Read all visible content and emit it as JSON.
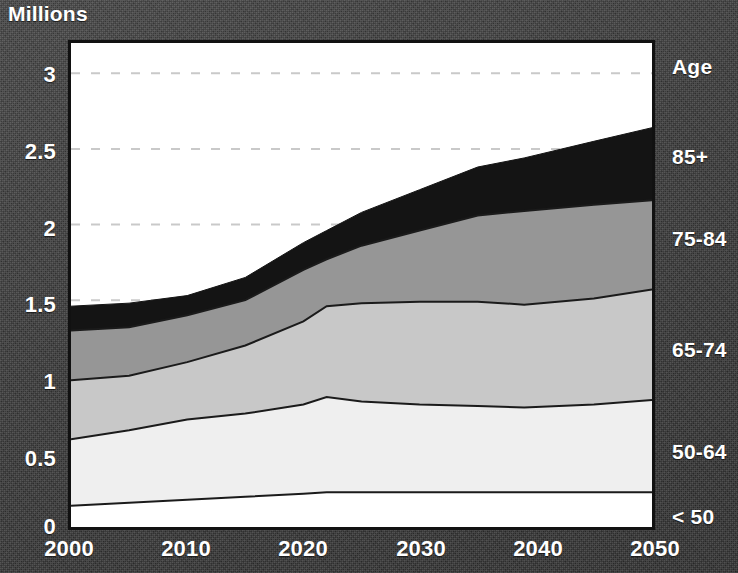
{
  "title": "Millions",
  "axis": {
    "y_label": "Millions",
    "y_ticks": [
      "3",
      "2.5",
      "2",
      "1.5",
      "1",
      "0.5",
      "0"
    ],
    "x_ticks": [
      "2000",
      "2010",
      "2020",
      "2030",
      "2040",
      "2050"
    ]
  },
  "legend": {
    "header": "Age",
    "items": [
      {
        "label": "85+",
        "color": "#141414"
      },
      {
        "label": "75-84",
        "color": "#969696"
      },
      {
        "label": "65-74",
        "color": "#c8c8c8"
      },
      {
        "label": "50-64",
        "color": "#efefef"
      },
      {
        "label": "< 50",
        "color": "#ffffff"
      }
    ]
  },
  "chart_data": {
    "type": "area",
    "stacked": true,
    "title": "Millions",
    "xlabel": "",
    "ylabel": "Millions",
    "xlim": [
      2000,
      2050
    ],
    "ylim": [
      0,
      3.2
    ],
    "grid": true,
    "grid_style": "dashed",
    "grid_values": [
      1.5,
      2.0,
      2.5,
      3.0
    ],
    "legend_position": "right",
    "x": [
      2000,
      2005,
      2010,
      2015,
      2020,
      2022,
      2025,
      2030,
      2035,
      2039,
      2045,
      2050
    ],
    "series": [
      {
        "name": "< 50",
        "color": "#ffffff",
        "values": [
          0.14,
          0.16,
          0.18,
          0.2,
          0.22,
          0.23,
          0.23,
          0.23,
          0.23,
          0.23,
          0.23,
          0.23
        ]
      },
      {
        "name": "50-64",
        "color": "#efefef",
        "values": [
          0.44,
          0.48,
          0.53,
          0.55,
          0.59,
          0.63,
          0.6,
          0.58,
          0.57,
          0.56,
          0.58,
          0.61
        ]
      },
      {
        "name": "65-74",
        "color": "#c8c8c8",
        "values": [
          0.39,
          0.36,
          0.38,
          0.45,
          0.55,
          0.6,
          0.65,
          0.68,
          0.69,
          0.68,
          0.7,
          0.73
        ]
      },
      {
        "name": "75-84",
        "color": "#969696",
        "values": [
          0.33,
          0.32,
          0.31,
          0.3,
          0.34,
          0.31,
          0.38,
          0.47,
          0.57,
          0.62,
          0.62,
          0.59
        ]
      },
      {
        "name": "85+",
        "color": "#141414",
        "values": [
          0.16,
          0.16,
          0.13,
          0.15,
          0.18,
          0.19,
          0.22,
          0.27,
          0.32,
          0.35,
          0.42,
          0.48
        ]
      }
    ],
    "totals": [
      1.46,
      1.48,
      1.53,
      1.65,
      1.88,
      1.96,
      2.08,
      2.23,
      2.38,
      2.44,
      2.55,
      2.64
    ]
  }
}
